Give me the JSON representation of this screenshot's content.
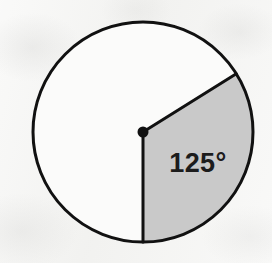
{
  "figure": {
    "type": "circle-sector-diagram",
    "background_color": "#f3f3f1"
  },
  "circle": {
    "name": "circle-outline",
    "center_x": 143,
    "center_y": 132,
    "radius": 110,
    "stroke_color": "#111111",
    "stroke_width": 3,
    "fill_color": "#fbfbfa"
  },
  "center_point": {
    "name": "center-dot",
    "x": 143,
    "y": 132,
    "radius": 5.5,
    "color": "#111111"
  },
  "sector": {
    "name": "shaded-sector",
    "fill_color": "#c9c9c9",
    "angle_degrees": 125,
    "start_angle_degrees": 32,
    "end_angle_degrees": -90
  },
  "radii": [
    {
      "name": "radius-upper-right",
      "angle_degrees": 32,
      "x1": 143,
      "y1": 132,
      "x2": 236,
      "y2": 73,
      "stroke_color": "#111111",
      "stroke_width": 3
    },
    {
      "name": "radius-down",
      "angle_degrees": -90,
      "x1": 143,
      "y1": 132,
      "x2": 143,
      "y2": 242,
      "stroke_color": "#111111",
      "stroke_width": 3
    }
  ],
  "angle_label": {
    "name": "angle-label",
    "text": "125°",
    "value": 125,
    "unit": "degrees",
    "x": 198,
    "y": 172,
    "color": "#1c1c1c"
  }
}
